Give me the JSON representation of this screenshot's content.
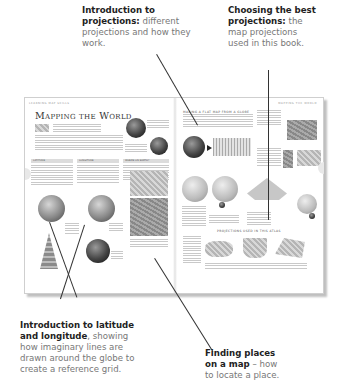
{
  "callouts": {
    "projections_intro": {
      "bold": "Introduction to projections:",
      "text": "different projections and how they work."
    },
    "best_projections": {
      "bold": "Choosing the best projections:",
      "text": "the map projections used in this book."
    },
    "latlong_intro": {
      "bold": "Introduction to latitude and longitude",
      "text": ", showing how imaginary lines are drawn around the globe to create a reference grid."
    },
    "finding_places": {
      "bold": "Finding places on a map",
      "text": " – how to locate a place."
    }
  },
  "spread": {
    "left_running_head": "LEARNING MAP SKILLS",
    "right_running_head": "MAPPING THE WORLD",
    "title": "Mapping the World",
    "columns": [
      "LATITUDE",
      "LONGITUDE",
      "WHERE ON EARTH?"
    ],
    "right_heading": "MAKING A FLAT MAP FROM A GLOBE",
    "projections_heading": "PROJECTIONS USED IN THIS ATLAS"
  }
}
